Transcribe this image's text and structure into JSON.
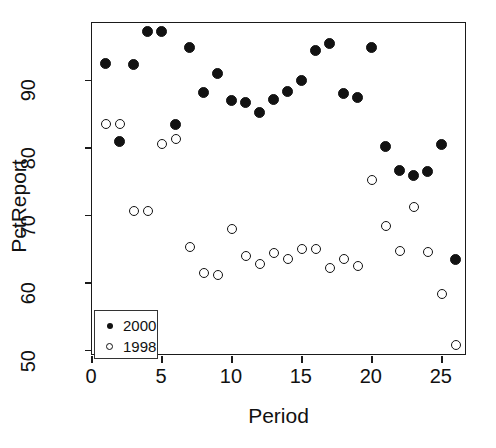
{
  "chart_data": {
    "type": "scatter",
    "title": "",
    "xlabel": "Period",
    "ylabel": "PctReport",
    "xlim": [
      0,
      26.8
    ],
    "ylim": [
      49.2,
      98.5
    ],
    "xticks": [
      0,
      5,
      10,
      15,
      20,
      25
    ],
    "yticks": [
      50,
      60,
      70,
      80,
      90
    ],
    "grid": false,
    "legend_position": "bottom-left",
    "series": [
      {
        "name": "2000",
        "marker": "filled-circle",
        "color": "#121212",
        "x": [
          1,
          2,
          3,
          4,
          5,
          6,
          7,
          8,
          9,
          10,
          11,
          12,
          13,
          14,
          15,
          16,
          17,
          18,
          19,
          20,
          21,
          22,
          23,
          24,
          25,
          26
        ],
        "y": [
          92.5,
          81.0,
          92.3,
          97.3,
          97.3,
          83.4,
          94.8,
          88.2,
          91.0,
          87.0,
          86.7,
          85.3,
          87.2,
          88.4,
          90.0,
          94.5,
          95.5,
          88.0,
          87.4,
          94.8,
          80.2,
          76.6,
          75.9,
          76.5,
          80.5,
          63.5
        ]
      },
      {
        "name": "1998",
        "marker": "open-circle",
        "color": "#121212",
        "x": [
          1,
          2,
          3,
          4,
          5,
          6,
          7,
          8,
          9,
          10,
          11,
          12,
          13,
          14,
          15,
          16,
          17,
          18,
          19,
          20,
          21,
          22,
          23,
          24,
          25,
          26
        ],
        "y": [
          83.5,
          83.6,
          70.6,
          70.7,
          80.6,
          81.4,
          65.3,
          61.5,
          61.2,
          68.0,
          64.0,
          62.8,
          64.4,
          63.5,
          65.0,
          65.0,
          62.3,
          63.5,
          62.5,
          75.2,
          68.4,
          64.8,
          71.2,
          64.6,
          58.4,
          50.8
        ]
      }
    ],
    "legend": [
      {
        "label": "2000",
        "marker": "filled-circle"
      },
      {
        "label": "1998",
        "marker": "open-circle"
      }
    ]
  },
  "axis": {
    "y_title": "PctReport",
    "x_title": "Period",
    "x_tick_labels": [
      "0",
      "5",
      "10",
      "15",
      "20",
      "25"
    ],
    "y_tick_labels": [
      "50",
      "60",
      "70",
      "80",
      "90"
    ]
  }
}
